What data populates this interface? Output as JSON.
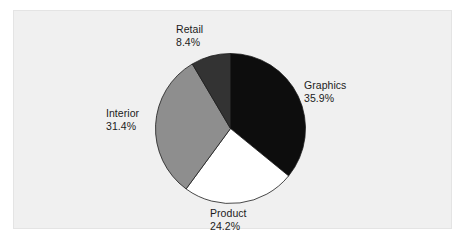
{
  "chart_data": {
    "type": "pie",
    "title": "",
    "subtitle": "",
    "xlabel": "",
    "ylabel": "",
    "legend_position": "none",
    "grid": false,
    "labels_outside": true,
    "start_angle_deg": 0,
    "direction": "clockwise",
    "categories": [
      "Graphics",
      "Product",
      "Interior",
      "Retail"
    ],
    "values": [
      35.9,
      24.2,
      31.4,
      8.4
    ],
    "value_suffix": "%",
    "slices": [
      {
        "name": "Graphics",
        "value": 35.9,
        "value_text": "35.9%",
        "color": "#0d0d0d",
        "start_deg": 0.0,
        "end_deg": 129.2
      },
      {
        "name": "Product",
        "value": 24.2,
        "value_text": "24.2%",
        "color": "#ffffff",
        "start_deg": 129.2,
        "end_deg": 216.3
      },
      {
        "name": "Interior",
        "value": 31.4,
        "value_text": "31.4%",
        "color": "#8e8e8e",
        "start_deg": 216.3,
        "end_deg": 329.4
      },
      {
        "name": "Retail",
        "value": 8.4,
        "value_text": "8.4%",
        "color": "#333333",
        "start_deg": 329.4,
        "end_deg": 360.0
      }
    ]
  },
  "figure": {
    "page_background": "#ffffff",
    "panel_background": "#f0f0f0",
    "panel_border": "#e4e4e4",
    "slice_outline": "#1a1a1a",
    "text_color": "#1b1b1b"
  }
}
